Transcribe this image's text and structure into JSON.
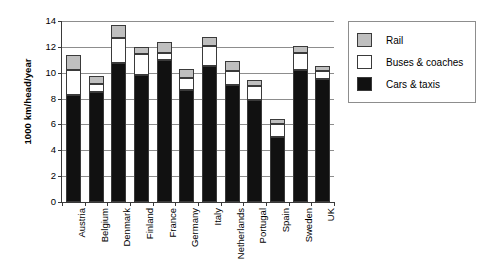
{
  "chart_data": {
    "type": "bar",
    "stacked": true,
    "title": "",
    "xlabel": "",
    "ylabel": "1000 km/head/year",
    "ylim": [
      0,
      14
    ],
    "ytick_step": 2,
    "yticks": [
      "0",
      "2",
      "4",
      "6",
      "8",
      "10",
      "12",
      "14"
    ],
    "grid": "horizontal",
    "legend_position": "right",
    "categories": [
      "Austria",
      "Belgium",
      "Denmark",
      "Finland",
      "France",
      "Germany",
      "Italy",
      "Netherlands",
      "Portugal",
      "Spain",
      "Sweden",
      "UK"
    ],
    "series": [
      {
        "name": "Cars & taxis",
        "color": "#111111",
        "values": [
          8.25,
          8.5,
          10.75,
          9.8,
          11.0,
          8.65,
          10.5,
          9.05,
          7.9,
          5.0,
          10.2,
          9.5
        ]
      },
      {
        "name": "Buses & coaches",
        "color": "#ffffff",
        "values": [
          1.95,
          0.65,
          1.9,
          1.65,
          0.55,
          0.95,
          1.55,
          1.05,
          1.1,
          1.0,
          1.3,
          0.6
        ]
      },
      {
        "name": "Rail",
        "color": "#bfbfbf",
        "values": [
          1.15,
          0.6,
          1.05,
          0.55,
          0.85,
          0.7,
          0.75,
          0.8,
          0.45,
          0.4,
          0.55,
          0.4
        ]
      }
    ],
    "totals": [
      11.35,
      9.75,
      13.7,
      12.0,
      12.4,
      10.3,
      12.8,
      10.9,
      9.45,
      6.4,
      12.05,
      10.5
    ]
  },
  "legend": {
    "items": [
      {
        "label": "Rail",
        "swatch": "rail"
      },
      {
        "label": "Buses & coaches",
        "swatch": "buses"
      },
      {
        "label": "Cars & taxis",
        "swatch": "cars"
      }
    ]
  },
  "colors": {
    "cars": "#111111",
    "buses": "#ffffff",
    "rail": "#bfbfbf",
    "axis": "#3a3a3a",
    "gridline": "#8d8d8d"
  }
}
